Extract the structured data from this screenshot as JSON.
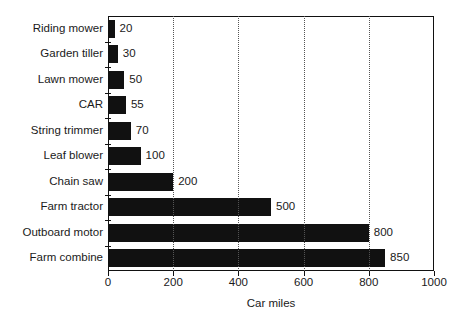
{
  "chart_data": {
    "type": "bar",
    "orientation": "horizontal",
    "title": "",
    "xlabel": "Car miles",
    "ylabel": "",
    "xlim": [
      0,
      1000
    ],
    "xticks": [
      0,
      200,
      400,
      600,
      800,
      1000
    ],
    "xtick_labels": [
      "0",
      "200",
      "400",
      "600",
      "800",
      "1000"
    ],
    "grid": "vertical-dotted",
    "legend": "none",
    "bar_color": "#111111",
    "categories": [
      "Riding mower",
      "Garden tiller",
      "Lawn mower",
      "CAR",
      "String trimmer",
      "Leaf blower",
      "Chain saw",
      "Farm tractor",
      "Outboard motor",
      "Farm combine"
    ],
    "values": [
      20,
      30,
      50,
      55,
      70,
      100,
      200,
      500,
      800,
      850
    ],
    "value_labels": [
      "20",
      "30",
      "50",
      "55",
      "70",
      "100",
      "200",
      "500",
      "800",
      "850"
    ]
  }
}
